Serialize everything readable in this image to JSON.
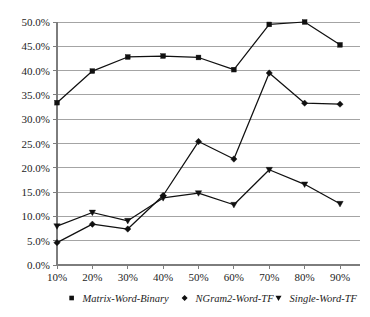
{
  "chart_data": {
    "type": "line",
    "title": "",
    "subtitle": "",
    "xlabel": "",
    "ylabel": "",
    "x": [
      "10%",
      "20%",
      "30%",
      "40%",
      "50%",
      "60%",
      "70%",
      "80%",
      "90%"
    ],
    "categories": [
      "10%",
      "20%",
      "30%",
      "40%",
      "50%",
      "60%",
      "70%",
      "80%",
      "90%"
    ],
    "xlim": [
      "10%",
      "90%"
    ],
    "ylim": [
      0,
      50
    ],
    "ytick_values": [
      0,
      5,
      10,
      15,
      20,
      25,
      30,
      35,
      40,
      45,
      50
    ],
    "ytick_labels": [
      "0.0%",
      "5.0%",
      "10.0%",
      "15.0%",
      "20.0%",
      "25.0%",
      "30.0%",
      "35.0%",
      "40.0%",
      "45.0%",
      "50.0%"
    ],
    "xtick_labels": [
      "10%",
      "20%",
      "30%",
      "40%",
      "50%",
      "60%",
      "70%",
      "80%",
      "90%"
    ],
    "grid": true,
    "grid_axis": "y",
    "legend_position": "bottom",
    "series": [
      {
        "name": "Matrix-Word-Binary",
        "marker": "square",
        "color": "#101010",
        "values": [
          33.4,
          39.9,
          42.8,
          43.0,
          42.7,
          40.2,
          49.5,
          50.0,
          45.3
        ]
      },
      {
        "name": "NGram2-Word-TF",
        "marker": "diamond",
        "color": "#101010",
        "values": [
          4.6,
          8.4,
          7.4,
          14.3,
          25.4,
          21.8,
          39.5,
          33.3,
          33.1
        ]
      },
      {
        "name": "Single-Word-TF",
        "marker": "triangle-down",
        "color": "#101010",
        "values": [
          8.0,
          10.8,
          9.1,
          13.8,
          14.8,
          12.4,
          19.6,
          16.6,
          12.6
        ]
      }
    ]
  },
  "legend": {
    "items": [
      {
        "label": "Matrix-Word-Binary",
        "marker": "square"
      },
      {
        "label": "NGram2-Word-TF",
        "marker": "diamond"
      },
      {
        "label": "Single-Word-TF",
        "marker": "triangle-down"
      }
    ]
  },
  "axes": {
    "y_labels": [
      "50.0%",
      "45.0%",
      "40.0%",
      "35.0%",
      "30.0%",
      "25.0%",
      "20.0%",
      "15.0%",
      "10.0%",
      "5.0%",
      "0.0%"
    ],
    "x_labels": [
      "10%",
      "20%",
      "30%",
      "40%",
      "50%",
      "60%",
      "70%",
      "80%",
      "90%"
    ]
  }
}
